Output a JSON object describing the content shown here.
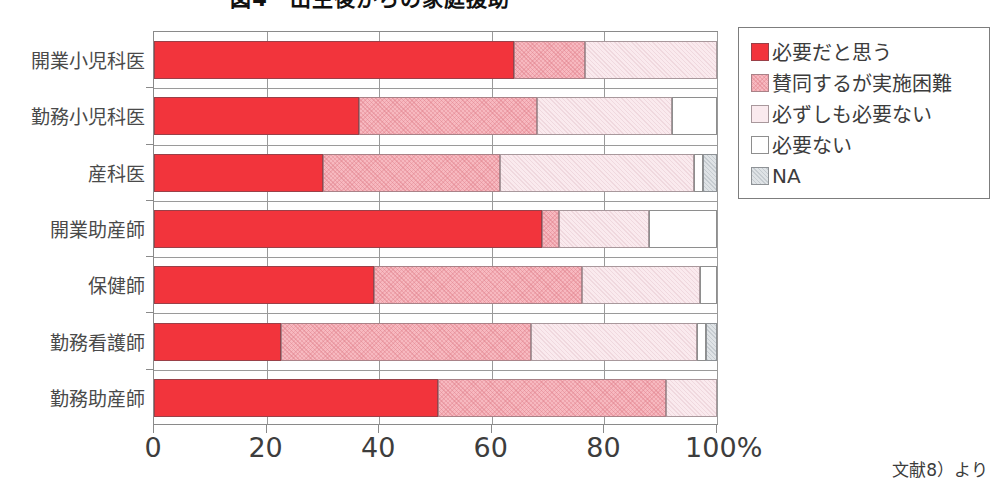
{
  "title": "図4　出生後からの家庭援助",
  "footnote": "文献8）より",
  "axis": {
    "x_ticks": [
      "0",
      "20",
      "40",
      "60",
      "80",
      "100%"
    ],
    "x_tick_values": [
      0,
      20,
      40,
      60,
      80,
      100
    ]
  },
  "legend": {
    "items": [
      {
        "label": "必要だと思う",
        "color": "#f2343c",
        "swatch": "legend-swatch-required"
      },
      {
        "label": "賛同するが実施困難",
        "color": "#f7b9c0",
        "swatch": "legend-swatch-agree-hard"
      },
      {
        "label": "必ずしも必要ない",
        "color": "#faeaee",
        "swatch": "legend-swatch-not-necessarily"
      },
      {
        "label": "必要ない",
        "color": "#ffffff",
        "swatch": "legend-swatch-not-needed"
      },
      {
        "label": "NA",
        "color": "#dfe3e6",
        "swatch": "legend-swatch-na"
      }
    ]
  },
  "chart_data": {
    "type": "bar",
    "orientation": "horizontal",
    "stacked": true,
    "stack_mode": "percent",
    "title": "図4　出生後からの家庭援助",
    "xlabel": "",
    "ylabel": "",
    "xlim": [
      0,
      100
    ],
    "grid": true,
    "legend_position": "top-right",
    "categories": [
      "開業小児科医",
      "勤務小児科医",
      "産科医",
      "開業助産師",
      "保健師",
      "勤務看護師",
      "勤務助産師"
    ],
    "series": [
      {
        "name": "必要だと思う",
        "color": "#f2343c",
        "values": [
          64.0,
          36.5,
          30.0,
          69.0,
          39.0,
          22.5,
          50.5
        ]
      },
      {
        "name": "賛同するが実施困難",
        "color": "#f7b9c0",
        "values": [
          12.5,
          31.5,
          31.5,
          3.0,
          37.0,
          44.5,
          40.5
        ]
      },
      {
        "name": "必ずしも必要ない",
        "color": "#faeaee",
        "values": [
          23.5,
          24.0,
          34.5,
          16.0,
          21.0,
          29.5,
          9.0
        ]
      },
      {
        "name": "必要ない",
        "color": "#ffffff",
        "values": [
          0.0,
          8.0,
          1.5,
          12.0,
          3.0,
          1.5,
          0.0
        ]
      },
      {
        "name": "NA",
        "color": "#dfe3e6",
        "values": [
          0.0,
          0.0,
          2.5,
          0.0,
          0.0,
          2.0,
          0.0
        ]
      }
    ]
  }
}
